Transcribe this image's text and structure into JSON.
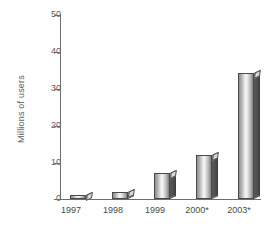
{
  "chart_data": {
    "type": "bar",
    "title": "",
    "xlabel": "",
    "ylabel": "Millions of users",
    "categories": [
      "1997",
      "1998",
      "1999",
      "2000*",
      "2003*"
    ],
    "values": [
      1,
      2,
      7,
      12,
      34
    ],
    "ylim": [
      0,
      50
    ],
    "yticks": [
      0,
      10,
      20,
      30,
      40,
      50
    ],
    "ytick_labels": [
      "0",
      "10",
      "20",
      "30",
      "40",
      "50"
    ],
    "grid": false,
    "legend": null,
    "series": [
      {
        "name": "Millions of users",
        "values": [
          1,
          2,
          7,
          12,
          34
        ]
      }
    ],
    "style": {
      "bar_face_light": "#f6f6f6",
      "bar_face_dark": "#8f8f8f",
      "bar_side": "#4f4f4f",
      "bar_outline": "#4a4a4a",
      "axis_color": "#6e6e6e",
      "text_color": "#4a4a4a",
      "background": "#ffffff"
    }
  }
}
